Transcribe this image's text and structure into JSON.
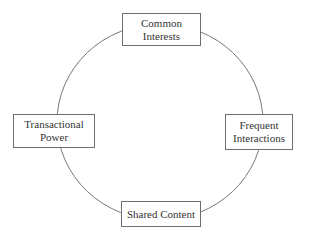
{
  "diagram": {
    "type": "cycle",
    "line_color": "#777777",
    "box_border_color": "#6e6e6e",
    "text_color": "#333333",
    "nodes": [
      {
        "id": "top",
        "lines": [
          "Common",
          "Interests"
        ]
      },
      {
        "id": "right",
        "lines": [
          "Frequent",
          "Interactions"
        ]
      },
      {
        "id": "bottom",
        "lines": [
          "Shared Content"
        ]
      },
      {
        "id": "left",
        "lines": [
          "Transactional",
          "Power"
        ]
      }
    ]
  }
}
